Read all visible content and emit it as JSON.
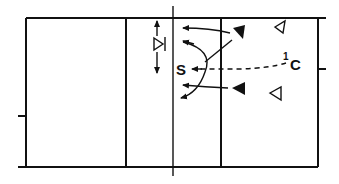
{
  "diagram": {
    "type": "volleyball-court-play-diagram",
    "colors": {
      "line": "#111111",
      "background": "#ffffff"
    },
    "labels": {
      "setter": "S",
      "center": "C",
      "center_number": "1"
    },
    "players": [
      {
        "id": "blocker-top",
        "symbol": "filled-triangle",
        "side": "right"
      },
      {
        "id": "blocker-bottom",
        "symbol": "filled-triangle",
        "side": "right"
      },
      {
        "id": "back-top",
        "symbol": "open-triangle",
        "side": "right"
      },
      {
        "id": "back-bottom",
        "symbol": "open-triangle",
        "side": "right"
      },
      {
        "id": "net-player",
        "symbol": "open-triangle-with-bar",
        "side": "left"
      }
    ],
    "movements": [
      {
        "from": "net-player",
        "type": "arrow-up-down"
      },
      {
        "from": "blocker-top",
        "type": "arrow-left"
      },
      {
        "from": "blocker-bottom",
        "type": "arrow-left"
      },
      {
        "from": "setter",
        "type": "curved-arrows"
      },
      {
        "from": "center",
        "to": "setter",
        "type": "dashed-path"
      }
    ]
  }
}
